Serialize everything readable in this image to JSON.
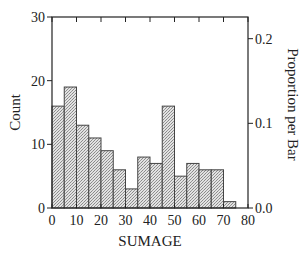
{
  "chart_data": {
    "type": "bar",
    "subtype": "histogram",
    "title": "",
    "xlabel": "SUMAGE",
    "ylabel": "Count",
    "y2label": "Proportion per Bar",
    "bin_width": 5,
    "bin_edges": [
      0,
      5,
      10,
      15,
      20,
      25,
      30,
      35,
      40,
      45,
      50,
      55,
      60,
      65,
      70,
      75
    ],
    "categories": [
      "0-5",
      "5-10",
      "10-15",
      "15-20",
      "20-25",
      "25-30",
      "30-35",
      "35-40",
      "40-45",
      "45-50",
      "50-55",
      "55-60",
      "60-65",
      "65-70",
      "70-75"
    ],
    "values": [
      16,
      19,
      13,
      11,
      9,
      6,
      3,
      8,
      7,
      16,
      5,
      7,
      6,
      6,
      1
    ],
    "xlim": [
      0,
      80
    ],
    "ylim": [
      0,
      30
    ],
    "y2lim": [
      0.0,
      0.2256
    ],
    "x_ticks": [
      "0",
      "10",
      "20",
      "30",
      "40",
      "50",
      "60",
      "70",
      "80"
    ],
    "y_ticks": [
      "0",
      "10",
      "20",
      "30"
    ],
    "y2_ticks": [
      "0.0",
      "0.1",
      "0.2"
    ],
    "grid": false,
    "legend": null,
    "bar_fill": "crosshatch-gray",
    "colors": {
      "bar_fill": "#c8c8c8",
      "bar_edge": "#444444",
      "axis": "#222222"
    }
  }
}
